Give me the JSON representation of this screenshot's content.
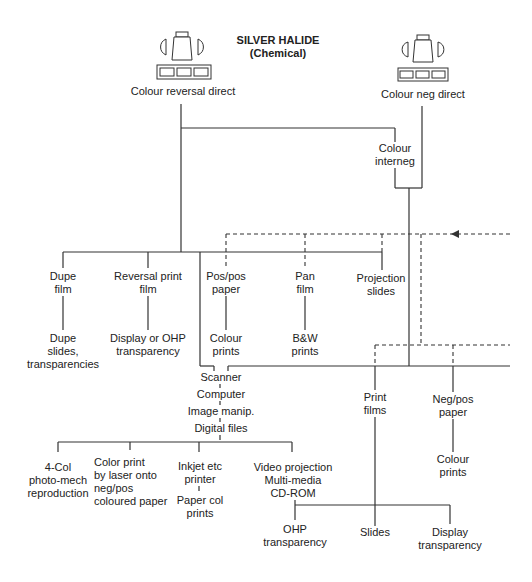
{
  "title": {
    "line1": "SILVER HALIDE",
    "line2": "(Chemical)"
  },
  "sources": [
    {
      "id": "colour-reversal-direct",
      "label": "Colour reversal direct",
      "icon": "camera-film-icon"
    },
    {
      "id": "colour-neg-direct",
      "label": "Colour neg direct",
      "icon": "camera-film-icon"
    }
  ],
  "nodes": {
    "colour_interneg": {
      "line1": "Colour",
      "line2": "interneg"
    },
    "dupe_film": {
      "line1": "Dupe",
      "line2": "film"
    },
    "reversal_print_film": {
      "line1": "Reversal print",
      "line2": "film"
    },
    "pos_pos_paper": {
      "line1": "Pos/pos",
      "line2": "paper"
    },
    "pan_film": {
      "line1": "Pan",
      "line2": "film"
    },
    "projection_slides": {
      "line1": "Projection",
      "line2": "slides"
    },
    "dupe_slides": {
      "line1": "Dupe",
      "line2": "slides,",
      "line3": "transparencies"
    },
    "display_ohp": {
      "line1": "Display or OHP",
      "line2": "transparency"
    },
    "colour_prints_1": {
      "line1": "Colour",
      "line2": "prints"
    },
    "bw_prints": {
      "line1": "B&W",
      "line2": "prints"
    },
    "scanner": "Scanner",
    "computer": "Computer",
    "image_manip": "Image manip.",
    "digital_files": "Digital files",
    "print_films": {
      "line1": "Print",
      "line2": "films"
    },
    "neg_pos_paper": {
      "line1": "Neg/pos",
      "line2": "paper"
    },
    "colour_prints_2": {
      "line1": "Colour",
      "line2": "prints"
    },
    "four_col": {
      "line1": "4-Col",
      "line2": "photo-mech",
      "line3": "reproduction"
    },
    "color_print_laser": {
      "line1": "Color print",
      "line2": "by laser onto",
      "line3": "neg/pos",
      "line4": "coloured paper"
    },
    "inkjet": {
      "line1": "Inkjet etc",
      "line2": "printer"
    },
    "paper_col_prints": {
      "line1": "Paper col",
      "line2": "prints"
    },
    "video_projection": {
      "line1": "Video projection",
      "line2": "Multi-media",
      "line3": "CD-ROM"
    },
    "ohp_transparency": {
      "line1": "OHP",
      "line2": "transparency"
    },
    "slides": "Slides",
    "display_transparency": {
      "line1": "Display",
      "line2": "transparency"
    }
  },
  "legend": {
    "solid_line": "direct path",
    "dashed_line": "alternate path (incoming arrow from right)"
  },
  "colors": {
    "line": "#333333",
    "text": "#222222",
    "background": "#ffffff"
  }
}
